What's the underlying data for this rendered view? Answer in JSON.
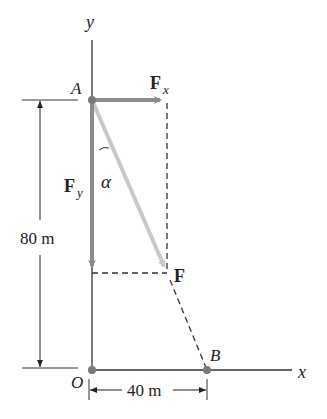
{
  "labels": {
    "y_axis": "y",
    "x_axis": "x",
    "point_a": "A",
    "point_b": "B",
    "point_o": "O",
    "force_fx_main": "F",
    "force_fx_sub": "x",
    "force_fy_main": "F",
    "force_fy_sub": "y",
    "force_f": "F",
    "angle": "α",
    "dim_vertical": "80 m",
    "dim_horizontal": "40 m"
  },
  "colors": {
    "axis": "#333333",
    "component_arrow": "#8c8c8c",
    "resultant_arrow": "#c8c8c8",
    "point": "#7a7a7a",
    "dashed": "#333333"
  }
}
